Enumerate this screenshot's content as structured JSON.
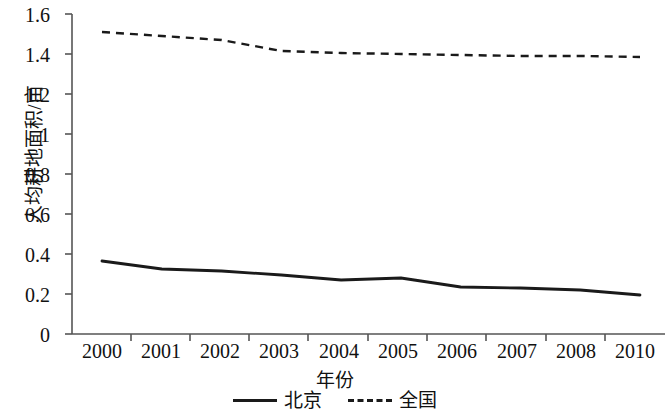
{
  "chart_data": {
    "type": "line",
    "title": "",
    "xlabel": "年份",
    "ylabel": "人均耕地面积/亩",
    "categories": [
      "2000",
      "2001",
      "2002",
      "2003",
      "2004",
      "2005",
      "2006",
      "2007",
      "2008",
      "2010"
    ],
    "x_tick_labels": [
      "2000",
      "2001",
      "2002",
      "2003",
      "2004",
      "2005",
      "2006",
      "2007",
      "2008",
      "2010"
    ],
    "y_tick_labels": [
      "0",
      "0.2",
      "0.4",
      "0.6",
      "0.8",
      "1",
      "1.2",
      "1.4",
      "1.6"
    ],
    "y_tick_values": [
      0,
      0.2,
      0.4,
      0.6,
      0.8,
      1,
      1.2,
      1.4,
      1.6
    ],
    "ylim": [
      0,
      1.6
    ],
    "grid": false,
    "legend_position": "bottom",
    "series": [
      {
        "name": "北京",
        "style": "solid",
        "color": "#1a1a1a",
        "values": [
          0.365,
          0.325,
          0.315,
          0.295,
          0.27,
          0.28,
          0.235,
          0.23,
          0.22,
          0.195
        ]
      },
      {
        "name": "全国",
        "style": "dashed",
        "color": "#1a1a1a",
        "values": [
          1.51,
          1.49,
          1.47,
          1.415,
          1.405,
          1.4,
          1.395,
          1.39,
          1.39,
          1.385
        ]
      }
    ]
  }
}
